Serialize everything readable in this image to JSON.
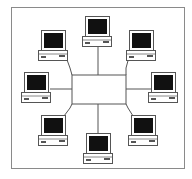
{
  "diagram": {
    "type": "network-topology",
    "hub": {
      "label": "",
      "x": 72,
      "y": 75,
      "w": 54,
      "h": 29
    },
    "computers": [
      {
        "id": "top",
        "x": 84,
        "y": 16
      },
      {
        "id": "top-left",
        "x": 40,
        "y": 30
      },
      {
        "id": "top-right",
        "x": 129,
        "y": 30
      },
      {
        "id": "left",
        "x": 23,
        "y": 72
      },
      {
        "id": "right",
        "x": 152,
        "y": 72
      },
      {
        "id": "bottom-left",
        "x": 41,
        "y": 115
      },
      {
        "id": "bottom-right",
        "x": 131,
        "y": 115
      },
      {
        "id": "bottom",
        "x": 86,
        "y": 133
      }
    ],
    "colors": {
      "line": "#555555",
      "screen": "#111111",
      "frame": "#8a8a8a"
    }
  }
}
